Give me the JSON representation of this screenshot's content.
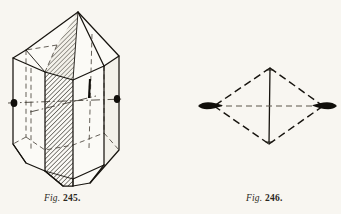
{
  "plate": {
    "background_color": "#f8f6f1",
    "ink_color": "#17140f",
    "figures": [
      {
        "id": "fig-245",
        "caption_prefix": "Fig.",
        "caption_number": "245.",
        "description": "Perspective drawing of a prismatic crystal with pyramidal terminations, one prism face shaded with diagonal hatching, hidden edges dashed, and a horizontal dash-dot crystallographic axis ending in solid black knobs at left and right",
        "shaded_face": "hatched",
        "hidden_edges": "dashed",
        "axis_style": "dash-dot",
        "axis_terminal": "solid-black-ellipse"
      },
      {
        "id": "fig-246",
        "caption_prefix": "Fig.",
        "caption_number": "246.",
        "description": "Rhombic outline (bipyramid projection) with dashed outer edges, a solid vertical axis joining top and bottom apices, a dashed horizontal axis, and elongated solid black lens shapes at the left and right lateral apices",
        "outline_style": "dashed",
        "vertical_axis_style": "solid",
        "horizontal_axis_style": "dashed",
        "axis_terminal": "solid-black-lens"
      }
    ]
  },
  "captions": {
    "fig245": {
      "prefix": "Fig.",
      "number": "245."
    },
    "fig246": {
      "prefix": "Fig.",
      "number": "246."
    }
  }
}
